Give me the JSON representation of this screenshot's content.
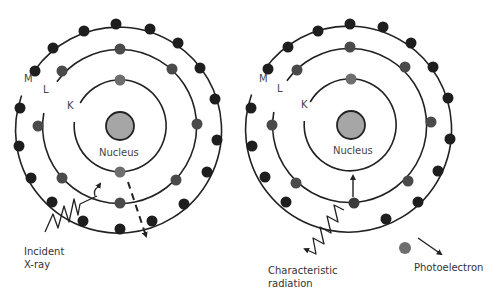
{
  "diagram": {
    "type": "atomic-shell-diagram",
    "colors": {
      "line": "#222222",
      "outer_electron": "#1e1e1e",
      "inner_electron": "#4a4a4a",
      "k_electron": "#6e6e6e",
      "nucleus_fill": "#a6a6a6",
      "text": "#333333"
    },
    "left_atom": {
      "shell_labels": {
        "m": "M",
        "l": "L",
        "k": "K"
      },
      "nucleus_label": "Nucleus",
      "incident_label_line1": "Incident",
      "incident_label_line2": "X-ray"
    },
    "right_atom": {
      "shell_labels": {
        "m": "M",
        "l": "L",
        "k": "K"
      },
      "nucleus_label": "Nucleus",
      "radiation_label_line1": "Characteristic",
      "radiation_label_line2": "radiation",
      "photoelectron_label": "Photoelectron"
    }
  }
}
